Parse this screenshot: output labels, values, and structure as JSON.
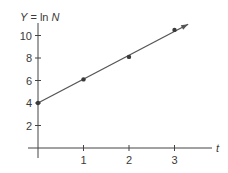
{
  "chart_data": {
    "type": "line",
    "title": "",
    "ylabel": "Y = ln N",
    "ylabel_parts": {
      "var": "Y",
      "eq": " = ln ",
      "arg": "N"
    },
    "xlabel": "t",
    "x_ticks": [
      "1",
      "2",
      "3"
    ],
    "y_ticks": [
      "2",
      "4",
      "6",
      "8",
      "10"
    ],
    "xlim": [
      0,
      3.8
    ],
    "ylim": [
      0,
      11
    ],
    "grid": false,
    "legend": null,
    "series": [
      {
        "name": "ln N",
        "points": [
          {
            "t": 0,
            "y": 4.0
          },
          {
            "t": 1,
            "y": 6.1
          },
          {
            "t": 2,
            "y": 8.1
          },
          {
            "t": 3,
            "y": 10.5
          }
        ],
        "fit_line": {
          "from": [
            0,
            4.0
          ],
          "to": [
            3.3,
            11.0
          ],
          "arrow": true
        }
      }
    ]
  },
  "colors": {
    "ink": "#3a3a3a",
    "background": "#ffffff"
  }
}
